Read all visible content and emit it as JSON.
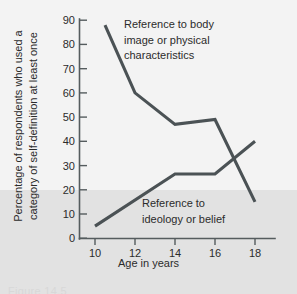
{
  "chart_data": {
    "type": "line",
    "title": "",
    "xlabel": "Age in years",
    "ylabel_lines": [
      "Percentage of respondents who used a",
      "category of self-definition at least once"
    ],
    "ylabel": "Percentage of respondents who used a category of self-definition at least once",
    "xlim": [
      9,
      19
    ],
    "ylim": [
      0,
      90
    ],
    "xticks": [
      10,
      12,
      14,
      16,
      18
    ],
    "yticks": [
      0,
      10,
      20,
      30,
      40,
      50,
      60,
      70,
      80,
      90
    ],
    "grid": false,
    "legend_position": "inline-annotations",
    "series": [
      {
        "name": "Reference to body image or physical characteristics",
        "annotation_lines": [
          "Reference to body",
          "image or physical",
          "characteristics"
        ],
        "x": [
          10.5,
          12,
          14,
          16,
          18
        ],
        "values": [
          88,
          60,
          47,
          49,
          15
        ]
      },
      {
        "name": "Reference to ideology or belief",
        "annotation_lines": [
          "Reference to",
          "ideology or belief"
        ],
        "x": [
          10,
          14,
          16,
          18
        ],
        "values": [
          5,
          26.5,
          26.5,
          40
        ]
      }
    ],
    "shaded_band": {
      "from": 0,
      "to": 20,
      "color": "#e2e2e2"
    },
    "colors": {
      "line": "#4b5255",
      "axis": "#555c5e",
      "text": "#2b2b2b",
      "background": "#f3f3f3",
      "band": "#e2e2e2"
    }
  },
  "caption": "Figure 14.5"
}
